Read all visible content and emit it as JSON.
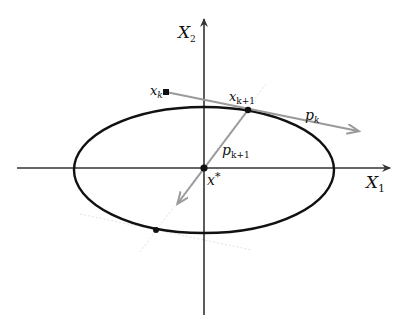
{
  "diagram": {
    "type": "conjugate-gradient-illustration",
    "colors": {
      "axis": "#333333",
      "ellipse": "#111111",
      "arrow": "#9a9a9a",
      "faint_guide": "#e2e2e2",
      "point": "#111111",
      "background": "#ffffff"
    },
    "axes": {
      "x1": {
        "label_main": "X",
        "label_sub": "1"
      },
      "x2": {
        "label_main": "X",
        "label_sub": "2"
      }
    },
    "points": {
      "xk": {
        "label_main": "x",
        "label_sub": "k"
      },
      "xk1": {
        "label_main": "x",
        "label_sub": "k+1"
      },
      "xstar": {
        "label_main": "x",
        "label_sup": "*"
      },
      "tangent_point": {
        "label_main": ""
      }
    },
    "vectors": {
      "pk": {
        "label_main": "p",
        "label_sub": "k"
      },
      "pk1": {
        "label_main": "p",
        "label_sub": "k+1"
      }
    },
    "ellipse": {
      "cx": 204,
      "cy": 168,
      "rx": 130,
      "ry": 63
    }
  }
}
